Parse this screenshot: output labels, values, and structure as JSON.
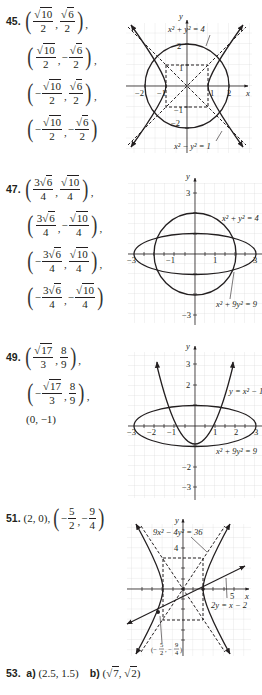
{
  "problems": [
    {
      "number": "45.",
      "solutions": [
        {
          "x_sign": "",
          "x_num": "10",
          "x_coef": "",
          "x_den": "2",
          "y_sign": "",
          "y_num": "6",
          "y_coef": "",
          "y_den": "2",
          "trail": ","
        },
        {
          "x_sign": "",
          "x_num": "10",
          "x_coef": "",
          "x_den": "2",
          "y_sign": "−",
          "y_num": "6",
          "y_coef": "",
          "y_den": "2",
          "trail": ","
        },
        {
          "x_sign": "−",
          "x_num": "10",
          "x_coef": "",
          "x_den": "2",
          "y_sign": "",
          "y_num": "6",
          "y_coef": "",
          "y_den": "2",
          "trail": ","
        },
        {
          "x_sign": "−",
          "x_num": "10",
          "x_coef": "",
          "x_den": "2",
          "y_sign": "−",
          "y_num": "6",
          "y_coef": "",
          "y_den": "2",
          "trail": ""
        }
      ],
      "graph": {
        "labels": {
          "circle": "x² + y² = 4",
          "hyperbola": "x² − y² = 1",
          "x_axis": "x",
          "y_axis": "y"
        },
        "ticks_x": [
          "−2",
          "−1",
          "1",
          "2"
        ],
        "ticks_y": [
          "2",
          "1",
          "−1",
          "−2"
        ]
      }
    },
    {
      "number": "47.",
      "solutions": [
        {
          "x_sign": "",
          "x_num": "6",
          "x_coef": "3",
          "x_den": "4",
          "y_sign": "",
          "y_num": "10",
          "y_coef": "",
          "y_den": "4",
          "trail": ","
        },
        {
          "x_sign": "",
          "x_num": "6",
          "x_coef": "3",
          "x_den": "4",
          "y_sign": "−",
          "y_num": "10",
          "y_coef": "",
          "y_den": "4",
          "trail": ","
        },
        {
          "x_sign": "−",
          "x_num": "6",
          "x_coef": "3",
          "x_den": "4",
          "y_sign": "",
          "y_num": "10",
          "y_coef": "",
          "y_den": "4",
          "trail": ","
        },
        {
          "x_sign": "−",
          "x_num": "6",
          "x_coef": "3",
          "x_den": "4",
          "y_sign": "−",
          "y_num": "10",
          "y_coef": "",
          "y_den": "4",
          "trail": ""
        }
      ],
      "graph": {
        "labels": {
          "circle": "x² + y² = 4",
          "ellipse": "x² + 9y² = 9",
          "y_axis": "y"
        },
        "ticks_x": [
          "−3",
          "−1",
          "1",
          "3"
        ],
        "ticks_y": [
          "3",
          "−3"
        ]
      }
    },
    {
      "number": "49.",
      "solutions": [
        {
          "x_sign": "",
          "x_num": "17",
          "x_coef": "",
          "x_den": "3",
          "y_plain_num": "8",
          "y_plain_den": "9",
          "trail": ","
        },
        {
          "x_sign": "−",
          "x_num": "17",
          "x_coef": "",
          "x_den": "3",
          "y_plain_num": "8",
          "y_plain_den": "9",
          "trail": ","
        }
      ],
      "extra": "(0, −1)",
      "graph": {
        "labels": {
          "parabola": "y = x² − 1",
          "ellipse": "x² + 9y² = 9",
          "y_axis": "y"
        },
        "ticks_x": [
          "−3",
          "−2",
          "−1",
          "1",
          "2",
          "3"
        ],
        "ticks_y": [
          "3",
          "2",
          "−2",
          "−3"
        ]
      }
    },
    {
      "number": "51.",
      "first": "(2, 0),",
      "second": {
        "sign": "−",
        "x_num": "5",
        "x_den": "2",
        "y_num": "9",
        "y_den": "4"
      },
      "graph": {
        "labels": {
          "hyperbola": "9x² − 4y² = 36",
          "line": "2y = x − 2",
          "point": "(−5/2, −9/4)",
          "x_axis": "x",
          "y_axis": "y"
        },
        "ticks_x": [
          "5"
        ],
        "ticks_y": [
          "4"
        ]
      }
    }
  ],
  "problem53": {
    "number": "53.",
    "a_label": "a)",
    "a_value": "(2.5, 1.5)",
    "b_label": "b)",
    "b_value_x": "7",
    "b_value_y": "2"
  }
}
